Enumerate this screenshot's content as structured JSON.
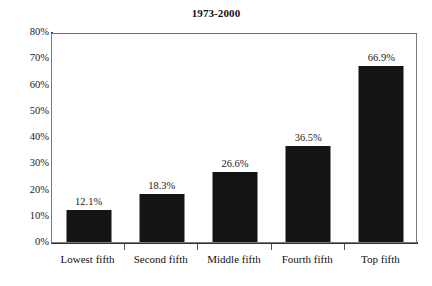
{
  "chart_data": {
    "type": "bar",
    "title": "1973-2000",
    "xlabel": "",
    "ylabel": "",
    "categories": [
      "Lowest fifth",
      "Second fifth",
      "Middle fifth",
      "Fourth fifth",
      "Top fifth"
    ],
    "values": [
      12.1,
      18.3,
      26.6,
      36.5,
      66.9
    ],
    "value_labels": [
      "12.1%",
      "18.3%",
      "26.6%",
      "36.5%",
      "66.9%"
    ],
    "ylim": [
      0,
      80
    ],
    "ytick_values": [
      0,
      10,
      20,
      30,
      40,
      50,
      60,
      70,
      80
    ],
    "ytick_labels": [
      "0%",
      "10%",
      "20%",
      "30%",
      "40%",
      "50%",
      "60%",
      "70%",
      "80%"
    ],
    "grid": false,
    "legend": false,
    "bar_color": "#141414",
    "axis_color": "#333333",
    "frame_color": "#7a7a7a",
    "background": "#ffffff",
    "text_color": "#111111"
  }
}
